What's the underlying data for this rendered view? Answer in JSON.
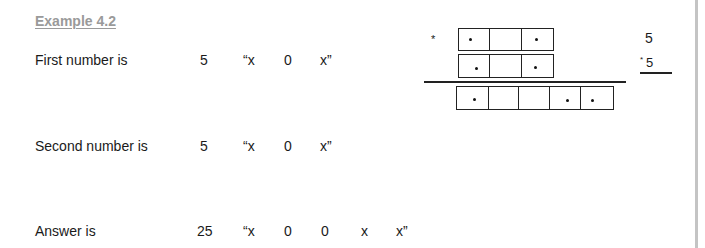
{
  "heading": "Example 4.2",
  "rows": [
    {
      "label": "First number is",
      "value": "5",
      "tokens": [
        "“x",
        "0",
        "x”"
      ]
    },
    {
      "label": "Second number is",
      "value": "5",
      "tokens": [
        "“x",
        "0",
        "x”"
      ]
    },
    {
      "label": "Answer is",
      "value": "25",
      "tokens": [
        "“x",
        "0",
        "0",
        "x",
        "x”"
      ]
    }
  ],
  "diagram": {
    "operator": "*",
    "row1_cells": [
      "dot",
      "empty",
      "dot"
    ],
    "row2_cells": [
      "dot",
      "empty",
      "dot"
    ],
    "result_cells": [
      "dot",
      "empty",
      "empty",
      "dot",
      "dot"
    ]
  },
  "side_calc": {
    "top": "5",
    "operator": "*",
    "bottom": "5"
  }
}
